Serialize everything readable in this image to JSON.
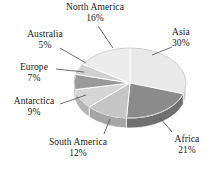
{
  "chart_data": {
    "type": "pie",
    "title": "",
    "subtitle": "",
    "xlabel": "",
    "ylabel": "",
    "legend_position": "none",
    "grid": false,
    "three_d": true,
    "value_unit": "%",
    "categories": [
      "Asia",
      "Africa",
      "South America",
      "Antarctica",
      "Europe",
      "Australia",
      "North America"
    ],
    "values": [
      30,
      21,
      12,
      9,
      7,
      5,
      16
    ],
    "slices": [
      {
        "label": "Asia",
        "value": 30,
        "display": "30%",
        "color": "#e9e9e9",
        "side_color": "#c9c9c9",
        "start_deg": 0,
        "end_deg": 108
      },
      {
        "label": "Africa",
        "value": 21,
        "display": "21%",
        "color": "#8b8b8b",
        "side_color": "#6f6f6f",
        "start_deg": 108,
        "end_deg": 183.6
      },
      {
        "label": "South America",
        "value": 12,
        "display": "12%",
        "color": "#c6c6c6",
        "side_color": "#a6a6a6",
        "start_deg": 183.6,
        "end_deg": 226.8
      },
      {
        "label": "Antarctica",
        "value": 9,
        "display": "9%",
        "color": "#d6d6d6",
        "side_color": "#b4b4b4",
        "start_deg": 226.8,
        "end_deg": 259.2
      },
      {
        "label": "Europe",
        "value": 7,
        "display": "7%",
        "color": "#9a9a9a",
        "side_color": "#7e7e7e",
        "start_deg": 259.2,
        "end_deg": 284.4
      },
      {
        "label": "Australia",
        "value": 5,
        "display": "5%",
        "color": "#d0d0d0",
        "side_color": "#aeaeae",
        "start_deg": 284.4,
        "end_deg": 302.4
      },
      {
        "label": "North America",
        "value": 16,
        "display": "16%",
        "color": "#ececec",
        "side_color": "#cacaca",
        "start_deg": 302.4,
        "end_deg": 360
      }
    ]
  },
  "labels": {
    "north_america": {
      "name": "North America",
      "percent": "16%"
    },
    "asia": {
      "name": "Asia",
      "percent": "30%"
    },
    "australia": {
      "name": "Australia",
      "percent": "5%"
    },
    "europe": {
      "name": "Europe",
      "percent": "7%"
    },
    "antarctica": {
      "name": "Antarctica",
      "percent": "9%"
    },
    "south_america": {
      "name": "South America",
      "percent": "12%"
    },
    "africa": {
      "name": "Africa",
      "percent": "21%"
    }
  },
  "colors": {
    "background": "#ffffff",
    "text": "#1a1a1a",
    "leader_line": "#4a4a4a",
    "slice_edge": "#ffffff"
  }
}
